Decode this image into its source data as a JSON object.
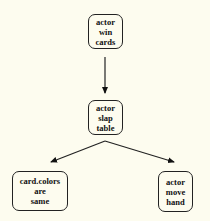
{
  "diagram": {
    "background": "#fdfcef",
    "nodes": [
      {
        "id": "n1",
        "lines": [
          "actor",
          "win",
          "cards"
        ]
      },
      {
        "id": "n2",
        "lines": [
          "actor",
          "slap",
          "table"
        ]
      },
      {
        "id": "n3",
        "lines": [
          "card.colors",
          "are",
          "same"
        ]
      },
      {
        "id": "n4",
        "lines": [
          "actor",
          "move",
          "hand"
        ]
      }
    ],
    "edges": [
      {
        "from": "n1",
        "to": "n2"
      },
      {
        "from": "n2",
        "to": "n3"
      },
      {
        "from": "n2",
        "to": "n4"
      }
    ]
  }
}
